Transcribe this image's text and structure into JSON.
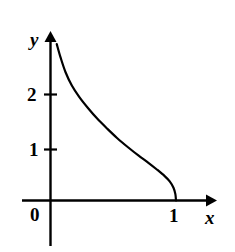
{
  "figure": {
    "background_color": "#ffffff",
    "ink_color": "#000000"
  },
  "labels": {
    "y_axis": "y",
    "x_axis": "x",
    "origin": "0"
  },
  "ticks": {
    "y": [
      {
        "label": "2",
        "value": 2
      },
      {
        "label": "1",
        "value": 1
      }
    ],
    "x": [
      {
        "label": "1",
        "value": 1
      }
    ]
  },
  "chart_data": {
    "type": "line",
    "title": "",
    "xlabel": "x",
    "ylabel": "y",
    "xlim": [
      0,
      1.25
    ],
    "ylim": [
      0,
      3.1
    ],
    "grid": false,
    "legend": null,
    "axes_style": {
      "arrows": [
        "x-positive",
        "y-positive"
      ],
      "spines": "centered-at-origin",
      "tick_marks": "short-crossing"
    },
    "xticks": [
      0,
      1
    ],
    "xticklabels": [
      "0",
      "1"
    ],
    "yticks": [
      1,
      2
    ],
    "yticklabels": [
      "1",
      "2"
    ],
    "series": [
      {
        "name": "curve",
        "style": "solid",
        "line_width": 2.2,
        "color": "#000000",
        "x": [
          0.05,
          0.08,
          0.12,
          0.17,
          0.23,
          0.3,
          0.37,
          0.45,
          0.53,
          0.62,
          0.7,
          0.78,
          0.85,
          0.91,
          0.95,
          0.98,
          0.995,
          1.0
        ],
        "y": [
          2.95,
          2.7,
          2.42,
          2.17,
          1.95,
          1.74,
          1.55,
          1.36,
          1.18,
          1.0,
          0.85,
          0.71,
          0.58,
          0.46,
          0.36,
          0.24,
          0.12,
          0.0
        ]
      }
    ],
    "annotations": []
  }
}
